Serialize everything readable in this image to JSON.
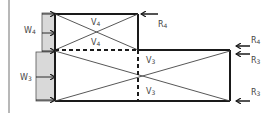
{
  "diagram": {
    "type": "structural-load-diagram",
    "colors": {
      "line": "#1a1a1a",
      "wind_block": "#d9d9d9",
      "margin_line": "#a0a0a0",
      "label": "#444444"
    },
    "wind_loads": [
      {
        "id": "w4",
        "label": "W",
        "sub": "4"
      },
      {
        "id": "w3",
        "label": "W",
        "sub": "3"
      }
    ],
    "shear_labels": {
      "upper_top": {
        "label": "V",
        "sub": "4"
      },
      "upper_bottom": {
        "label": "V",
        "sub": "4"
      },
      "lower_top": {
        "label": "V",
        "sub": "3"
      },
      "lower_bottom": {
        "label": "V",
        "sub": "3"
      }
    },
    "reactions": [
      {
        "id": "r4-top",
        "label": "R",
        "sub": "4"
      },
      {
        "id": "r4-right",
        "label": "R",
        "sub": "4"
      },
      {
        "id": "r3-right-top",
        "label": "R",
        "sub": "3"
      },
      {
        "id": "r3-right-bottom",
        "label": "R",
        "sub": "3"
      }
    ]
  }
}
